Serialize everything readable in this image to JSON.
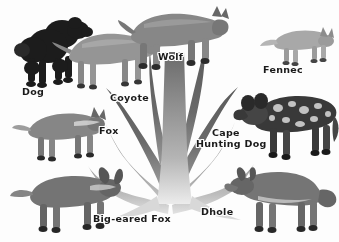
{
  "figure": {
    "type": "canid-family-tree-illustration",
    "background_color": "#fdfdfc",
    "label_color": "#1a1a1a",
    "trunk_color_dark": "#5e5e5e",
    "trunk_color_mid": "#8d8d8d",
    "trunk_color_light": "#c2c2c2",
    "width": 339,
    "height": 242
  },
  "labels": {
    "dog": "Dog",
    "coyote": "Coyote",
    "wolf": "Wolf",
    "fennec": "Fennec",
    "fox": "Fox",
    "cape_hunting_dog_line1": "Cape",
    "cape_hunting_dog_line2": "Hunting Dog",
    "big_eared_fox": "Big-eared Fox",
    "dhole": "Dhole"
  },
  "animals": [
    {
      "id": "dog",
      "label": "Dog",
      "description": "black poodle standing, facing right",
      "x": 8,
      "y": 6,
      "w": 96,
      "h": 86
    },
    {
      "id": "coyote",
      "label": "Coyote",
      "description": "coyote standing, facing right",
      "x": 52,
      "y": 14,
      "w": 110,
      "h": 82
    },
    {
      "id": "wolf",
      "label": "Wolf",
      "description": "grey wolf standing, facing right",
      "x": 118,
      "y": 2,
      "w": 112,
      "h": 72
    },
    {
      "id": "fennec",
      "label": "Fennec",
      "description": "fennec fox with large ears, facing right",
      "x": 260,
      "y": 24,
      "w": 76,
      "h": 44
    },
    {
      "id": "fox",
      "label": "Fox",
      "description": "red fox standing, facing right",
      "x": 12,
      "y": 104,
      "w": 98,
      "h": 60
    },
    {
      "id": "cape-hunting-dog",
      "label": "Cape Hunting Dog",
      "description": "African wild dog, mottled coat",
      "x": 228,
      "y": 86,
      "w": 110,
      "h": 78
    },
    {
      "id": "big-eared-fox",
      "label": "Big-eared Fox",
      "description": "bat-eared fox standing, facing right",
      "x": 10,
      "y": 164,
      "w": 118,
      "h": 72
    },
    {
      "id": "dhole",
      "label": "Dhole",
      "description": "dhole / Asiatic wild dog, facing left",
      "x": 228,
      "y": 162,
      "w": 110,
      "h": 76
    }
  ],
  "label_positions": {
    "dog": {
      "x": 22,
      "y": 86
    },
    "coyote": {
      "x": 110,
      "y": 92
    },
    "wolf": {
      "x": 158,
      "y": 51
    },
    "fennec": {
      "x": 263,
      "y": 64
    },
    "fox": {
      "x": 99,
      "y": 125
    },
    "cape": {
      "x": 212,
      "y": 127
    },
    "hunting_dog": {
      "x": 196,
      "y": 138
    },
    "big_eared_fox": {
      "x": 93,
      "y": 213
    },
    "dhole": {
      "x": 201,
      "y": 206
    }
  }
}
